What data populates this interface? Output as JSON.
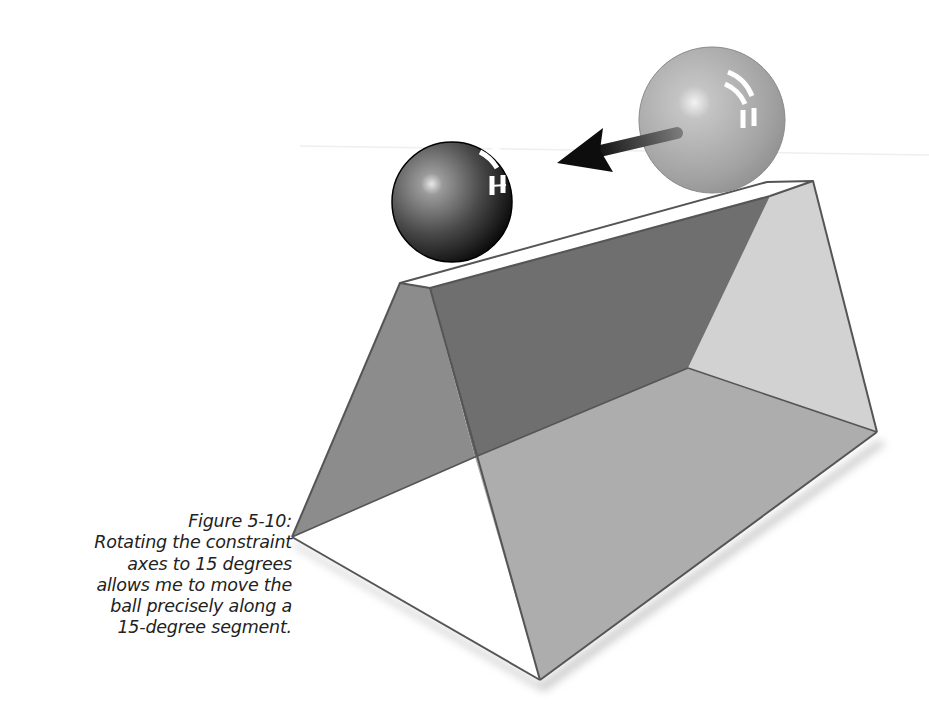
{
  "figure": {
    "label": "Figure 5-10:",
    "caption_lines": [
      "Rotating the constraint",
      "axes to 15 degrees",
      "allows me to move the",
      "ball precisely along a",
      "15-degree segment."
    ],
    "caption_full": "Figure 5-10: Rotating the constraint axes to 15 degrees allows me to move the ball precisely along a 15-degree segment."
  },
  "illustration": {
    "objects": [
      {
        "name": "triangular-prism",
        "description": "Transparent triangular prism viewed in perspective"
      },
      {
        "name": "ball-dark",
        "description": "Dark glossy ball resting on the prism ridge (destination)"
      },
      {
        "name": "ball-light",
        "description": "Light gray glossy ball (original position)"
      },
      {
        "name": "motion-arrow",
        "description": "Arrow pointing from the light ball to the dark ball along a 15-degree segment"
      }
    ],
    "colors": {
      "background": "#ffffff",
      "edge": "#555555",
      "left_face": "#8c8c8c",
      "back_face": "#6f6f6f",
      "right_face": "#d2d2d2",
      "front_face": "#adadad",
      "floor": "#ffffff",
      "ridge": "#ffffff",
      "shadow": "#d8d8d8",
      "ball_dark": "#1a1a1a",
      "ball_light": "#a8a8a8",
      "arrow": "#111111"
    }
  }
}
